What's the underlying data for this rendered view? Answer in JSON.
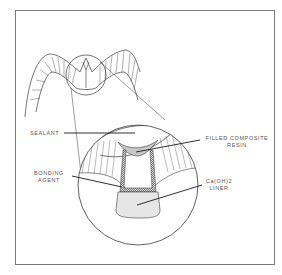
{
  "diagram": {
    "labels": {
      "sealant": "SEALANT",
      "filled_composite_line1": "FILLED COMPOSITE",
      "filled_composite_line2": "RESIN",
      "bonding_line1": "BONDING",
      "bonding_line2": "AGENT",
      "liner_line1": "Ca(OH)2",
      "liner_line2": "LINER"
    },
    "colors": {
      "stroke": "#3a3a3a",
      "frame": "#7a7a7a",
      "sealant_fill": "#c8c8c8",
      "liner_fill": "#e6e6e6",
      "label_text": "#555555"
    }
  }
}
